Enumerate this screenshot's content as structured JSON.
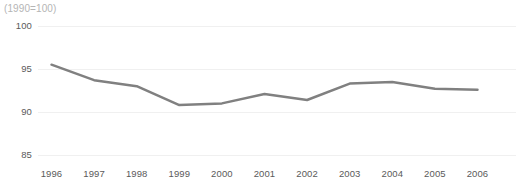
{
  "subtitle": "(1990=100)",
  "colors": {
    "line": "#808080",
    "gridline": "#f0f0f0",
    "tick_text": "#5a5a5a",
    "subtitle_text": "#b5b5b5",
    "background": "#ffffff"
  },
  "chart_data": {
    "type": "line",
    "title": "",
    "subtitle": "(1990=100)",
    "xlabel": "",
    "ylabel": "",
    "categories": [
      "1996",
      "1997",
      "1998",
      "1999",
      "2000",
      "2001",
      "2002",
      "2003",
      "2004",
      "2005",
      "2006"
    ],
    "x": [
      1996,
      1997,
      1998,
      1999,
      2000,
      2001,
      2002,
      2003,
      2004,
      2005,
      2006
    ],
    "values": [
      95.5,
      93.7,
      93.0,
      90.8,
      91.0,
      92.1,
      91.4,
      93.3,
      93.5,
      92.7,
      92.6
    ],
    "series": [
      {
        "name": "Index",
        "values": [
          95.5,
          93.7,
          93.0,
          90.8,
          91.0,
          92.1,
          91.4,
          93.3,
          93.5,
          92.7,
          92.6
        ]
      }
    ],
    "ylim": [
      85,
      100
    ],
    "yticks": [
      85,
      90,
      95,
      100
    ],
    "ytick_labels": [
      "85",
      "90",
      "95",
      "100"
    ],
    "xtick_labels": [
      "1996",
      "1997",
      "1998",
      "1999",
      "2000",
      "2001",
      "2002",
      "2003",
      "2004",
      "2005",
      "2006"
    ],
    "grid": true,
    "grid_axis": "y",
    "legend": false,
    "legend_position": "none",
    "markers": false,
    "line_color": "#808080",
    "line_width": 2.5
  }
}
